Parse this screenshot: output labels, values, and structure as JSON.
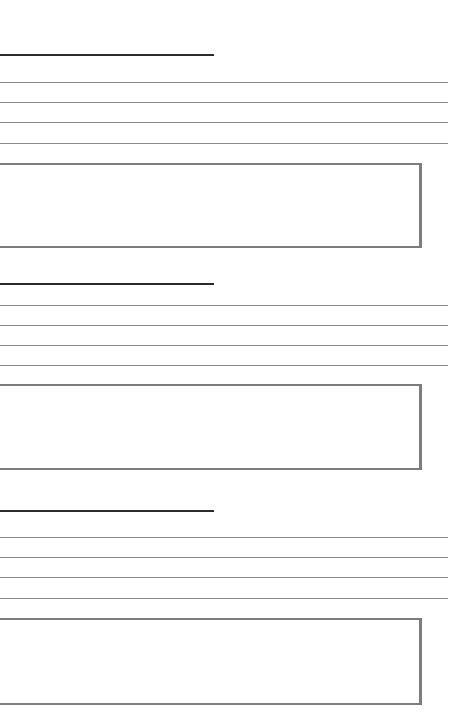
{
  "document": {
    "header_text": "",
    "sections": [
      {
        "heading": "",
        "lines": [
          "",
          "",
          "",
          ""
        ],
        "box_text": ""
      },
      {
        "heading": "",
        "lines": [
          "",
          "",
          "",
          ""
        ],
        "box_text": ""
      },
      {
        "heading": "",
        "lines": [
          "",
          "",
          "",
          ""
        ],
        "box_text": ""
      }
    ]
  },
  "colors": {
    "background": "#ffffff",
    "heading_rule": "#2b2b2b",
    "line": "#8a8a8a",
    "box_border": "#7d7d7d"
  }
}
